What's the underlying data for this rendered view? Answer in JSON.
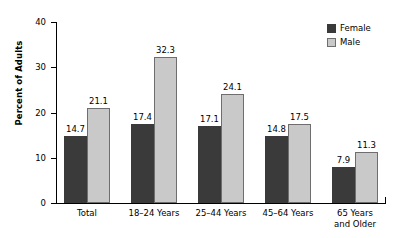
{
  "chart_data": {
    "type": "bar",
    "title": "",
    "subtitle": "",
    "xlabel": "",
    "ylabel": "Percent of Adults",
    "ylim": [
      0,
      40
    ],
    "yticks": [
      0,
      10,
      20,
      30,
      40
    ],
    "ytick_labels": [
      "0",
      "10",
      "20",
      "30",
      "40"
    ],
    "grid": false,
    "legend_position": "top-right",
    "categories": [
      "Total",
      "18–24 Years",
      "25–44 Years",
      "45–64 Years",
      "65 Years and Older"
    ],
    "category_lines": [
      [
        "Total",
        ""
      ],
      [
        "18–24 Years",
        ""
      ],
      [
        "25–44 Years",
        ""
      ],
      [
        "45–64 Years",
        ""
      ],
      [
        "65 Years",
        "and Older"
      ]
    ],
    "series": [
      {
        "name": "Female",
        "color": "#3a3a3a",
        "values": [
          14.7,
          17.4,
          17.1,
          14.8,
          7.9
        ],
        "labels": [
          "14.7",
          "17.4",
          "17.1",
          "14.8",
          "7.9"
        ]
      },
      {
        "name": "Male",
        "color": "#c9c9c9",
        "values": [
          21.1,
          32.3,
          24.1,
          17.5,
          11.3
        ],
        "labels": [
          "21.1",
          "32.3",
          "24.1",
          "17.5",
          "11.3"
        ]
      }
    ]
  },
  "legend": {
    "items": [
      {
        "label": "Female",
        "swatch": "#3a3a3a"
      },
      {
        "label": "Male",
        "swatch": "#c9c9c9"
      }
    ]
  },
  "axis": {
    "y_title": "Percent of Adults",
    "y_ticks": [
      "40",
      "30",
      "20",
      "10",
      "0"
    ]
  }
}
